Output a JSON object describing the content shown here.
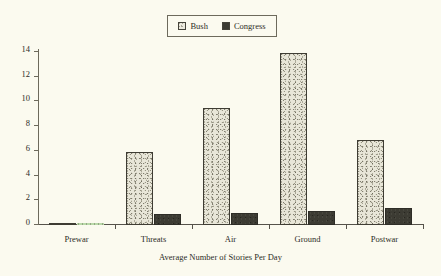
{
  "legend": {
    "entries": [
      {
        "label": "Bush",
        "swatch": "light-stipple-swatch",
        "color": "#e8e6d8"
      },
      {
        "label": "Congress",
        "swatch": "dark-solid-swatch",
        "color": "#3c3b33"
      }
    ]
  },
  "colors": {
    "background": "#fbfaef",
    "axis": "#55524a",
    "text": "#2d2c26",
    "bush": "#e8e6d8",
    "congress": "#3c3b33",
    "prewar_congress": "#b9d9a8"
  },
  "chart_data": {
    "type": "bar",
    "title": "",
    "subtitle": "",
    "xlabel": "Average Number of Stories Per Day",
    "ylabel": "",
    "categories": [
      "Prewar",
      "Threats",
      "Air",
      "Ground",
      "Postwar"
    ],
    "series": [
      {
        "name": "Bush",
        "values": [
          0.15,
          5.9,
          9.5,
          13.9,
          6.85
        ]
      },
      {
        "name": "Congress",
        "values": [
          0.05,
          0.9,
          1.0,
          1.1,
          1.35
        ]
      }
    ],
    "ylim": [
      0,
      14
    ],
    "yticks": [
      0,
      2,
      4,
      6,
      8,
      10,
      12,
      14
    ],
    "ytick_labels": [
      "0",
      "2",
      "4",
      "6",
      "8",
      "10",
      "12",
      "14"
    ],
    "grid": false,
    "legend_position": "top-center",
    "axis_style": "left-y-axis-and-bottom-x-axis-with-outward-ticks"
  }
}
